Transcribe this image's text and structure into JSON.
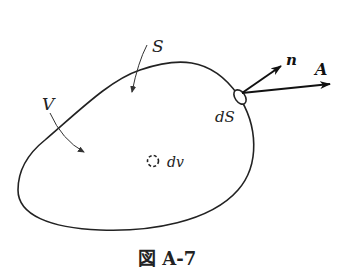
{
  "figure": {
    "caption": "図 A-7",
    "labels": {
      "surface": "S",
      "volume": "V",
      "surface_element": "dS",
      "volume_element": "dv",
      "normal_vector": "n",
      "field_vector": "A"
    },
    "colors": {
      "stroke": "#222222",
      "background": "#ffffff"
    }
  }
}
